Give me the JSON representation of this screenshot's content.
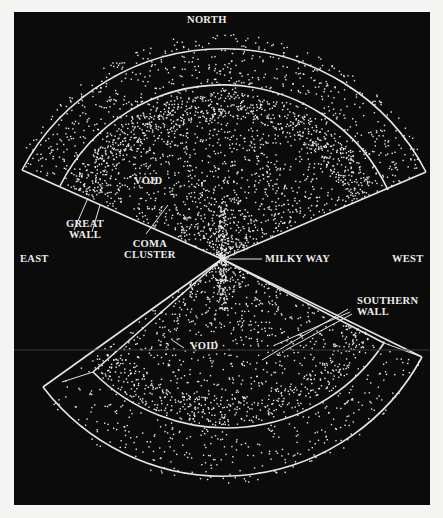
{
  "labels": {
    "north": "NORTH",
    "east": "EAST",
    "west": "WEST",
    "milky_way": "MILKY WAY",
    "void_north": "VOID",
    "void_south": "VOID",
    "great_wall": [
      "GREAT",
      "WALL"
    ],
    "coma_cluster": [
      "COMA",
      "CLUSTER"
    ],
    "southern_wall": [
      "SOUTHERN",
      "WALL"
    ]
  },
  "colors": {
    "background": "#0b0b0b",
    "page": "#f4f4f2",
    "galaxy": "#e8e8e8",
    "outline": "#e6e6e6"
  },
  "geometry": {
    "center": [
      222,
      259
    ],
    "north_fan": {
      "outer_radius": 228,
      "inner_radius": 182,
      "left_tip": [
        22,
        170
      ],
      "right_tip": [
        426,
        172
      ]
    },
    "south_fan": {
      "outer_radius": 226,
      "inner_radius": 188,
      "left_tip": [
        43,
        387
      ],
      "right_tip": [
        422,
        357
      ]
    }
  }
}
